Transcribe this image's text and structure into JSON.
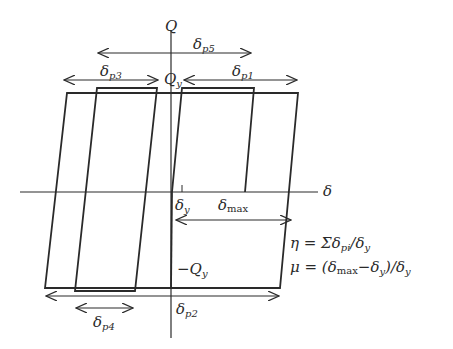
{
  "figure": {
    "type": "hysteresis-diagram",
    "axes": {
      "vertical_label": "Q",
      "horizontal_label": "δ"
    },
    "labels": {
      "Qy": {
        "main": "Q",
        "sub": "y"
      },
      "negQy": {
        "main": "−Q",
        "sub": "y"
      },
      "delta_y": {
        "main": "δ",
        "sub": "y"
      },
      "delta_max": {
        "main": "δ",
        "sub": "max"
      },
      "delta_p1": {
        "main": "δ",
        "sub": "p1"
      },
      "delta_p2": {
        "main": "δ",
        "sub": "p2"
      },
      "delta_p3": {
        "main": "δ",
        "sub": "p3"
      },
      "delta_p4": {
        "main": "δ",
        "sub": "p4"
      },
      "delta_p5": {
        "main": "δ",
        "sub": "p5"
      }
    },
    "equations": {
      "eta": {
        "lhs": "η = Σδ",
        "sub1": "pi",
        "mid": "/δ",
        "sub2": "y"
      },
      "mu": {
        "lhs": "μ = (δ",
        "sub1": "max",
        "mid": "−δ",
        "sub2": "y",
        "mid2": ")/δ",
        "sub3": "y"
      }
    },
    "line_color": "#2a2a2a"
  }
}
